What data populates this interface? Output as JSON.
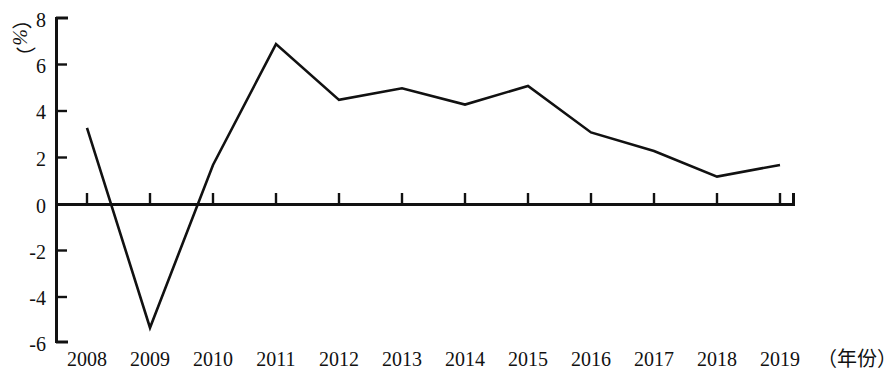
{
  "chart_data": {
    "type": "line",
    "title": "",
    "subtitle": "",
    "xlabel": "（年份）",
    "ylabel": "（%）",
    "categories": [
      "2008",
      "2009",
      "2010",
      "2011",
      "2012",
      "2013",
      "2014",
      "2015",
      "2016",
      "2017",
      "2018",
      "2019"
    ],
    "values": [
      3.3,
      -5.3,
      1.7,
      6.9,
      4.5,
      5.0,
      4.3,
      5.1,
      3.1,
      2.3,
      1.2,
      1.7
    ],
    "series": [
      {
        "name": "增长率",
        "values": [
          3.3,
          -5.3,
          1.7,
          6.9,
          4.5,
          5.0,
          4.3,
          5.1,
          3.1,
          2.3,
          1.2,
          1.7
        ]
      }
    ],
    "ylim": [
      -6,
      8
    ],
    "ytick_labels": [
      "8",
      "6",
      "4",
      "2",
      "0",
      "-2",
      "-4",
      "-6"
    ],
    "ytick_values": [
      8,
      6,
      4,
      2,
      0,
      -2,
      -4,
      -6
    ],
    "xtick_labels": [
      "2008",
      "2009",
      "2010",
      "2011",
      "2012",
      "2013",
      "2014",
      "2015",
      "2016",
      "2017",
      "2018",
      "2019"
    ],
    "grid": false,
    "legend": false,
    "legend_position": "none",
    "line_color": "#111111",
    "line_width": 2.6,
    "background_color": "#ffffff",
    "markers": false,
    "zero_line": true
  },
  "axes": {
    "y_unit": "（%）",
    "x_unit": "（年份）",
    "y_labels": {
      "0": "8",
      "1": "6",
      "2": "4",
      "3": "2",
      "4": "0",
      "5": "-2",
      "6": "-4",
      "7": "-6"
    },
    "x_labels": {
      "0": "2008",
      "1": "2009",
      "2": "2010",
      "3": "2011",
      "4": "2012",
      "5": "2013",
      "6": "2014",
      "7": "2015",
      "8": "2016",
      "9": "2017",
      "10": "2018",
      "11": "2019"
    }
  }
}
